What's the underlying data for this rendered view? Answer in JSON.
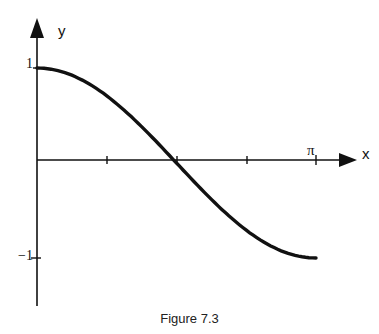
{
  "chart_data": {
    "type": "line",
    "title": "Figure 7.3",
    "xlabel": "x",
    "ylabel": "y",
    "x_tick_labels": [
      "π"
    ],
    "y_tick_labels": [
      "1",
      "-1"
    ],
    "x_ticks": [
      0.785,
      1.571,
      2.356,
      3.1416
    ],
    "xlim": [
      0,
      3.1416
    ],
    "ylim": [
      -1,
      1
    ],
    "grid": false,
    "series": [
      {
        "name": "y = cos x",
        "x": [
          0,
          0.3927,
          0.7854,
          1.1781,
          1.5708,
          1.9635,
          2.3562,
          2.7489,
          3.1416
        ],
        "values": [
          1,
          0.924,
          0.707,
          0.383,
          0,
          -0.383,
          -0.707,
          -0.924,
          -1
        ]
      }
    ]
  },
  "labels": {
    "y_axis": "y",
    "x_axis": "x",
    "y_one": "1",
    "y_minus_one": "−1",
    "pi": "π",
    "caption": "Figure 7.3"
  }
}
